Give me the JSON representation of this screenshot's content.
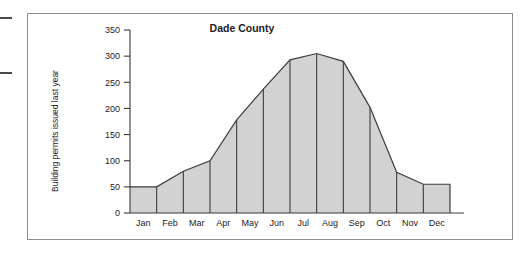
{
  "figure": {
    "margin_marks": [
      "margin-rule-top",
      "margin-rule-mid"
    ]
  },
  "chart_data": {
    "type": "area",
    "title": "Dade County",
    "xlabel": "",
    "ylabel": "Building permits issued last year",
    "categories": [
      "Jan",
      "Feb",
      "Mar",
      "Apr",
      "May",
      "Jun",
      "Jul",
      "Aug",
      "Sep",
      "Oct",
      "Nov",
      "Dec"
    ],
    "values": [
      50,
      50,
      80,
      100,
      178,
      237,
      293,
      305,
      290,
      202,
      78,
      55
    ],
    "ylim": [
      0,
      350
    ],
    "yticks": [
      0,
      50,
      100,
      150,
      200,
      250,
      300,
      350
    ],
    "ytick_labels": [
      "0",
      "50",
      "100",
      "150",
      "200",
      "250",
      "300",
      "350"
    ],
    "grid": false,
    "legend": "none",
    "fill_color": "#d2d2d2",
    "line_color": "#3d3d3d",
    "axis_color": "#3a3a3a"
  }
}
